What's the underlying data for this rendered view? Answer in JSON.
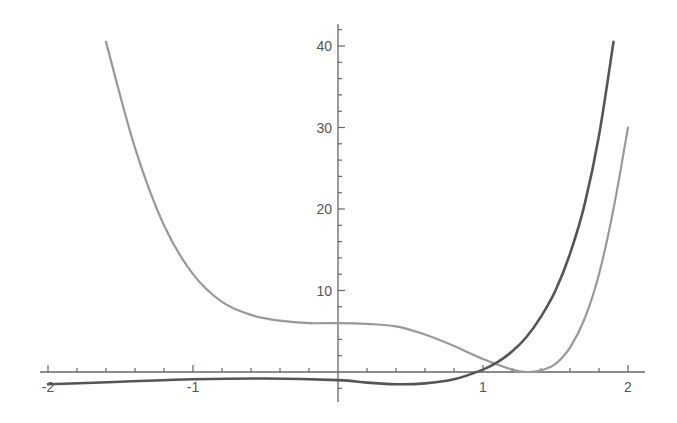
{
  "chart_data": {
    "type": "line",
    "title": "",
    "xlabel": "",
    "ylabel": "",
    "xlim": [
      -2,
      2
    ],
    "ylim": [
      -2,
      42
    ],
    "grid": false,
    "legend": null,
    "axes_style": "axes through origin",
    "x_ticks": [
      {
        "value": -2,
        "label": "-2"
      },
      {
        "value": -1,
        "label": "-1"
      },
      {
        "value": 1,
        "label": "1"
      },
      {
        "value": 2,
        "label": "2"
      }
    ],
    "y_ticks": [
      {
        "value": 10,
        "label": "10"
      },
      {
        "value": 20,
        "label": "20"
      },
      {
        "value": 30,
        "label": "30"
      },
      {
        "value": 40,
        "label": "40"
      }
    ],
    "series": [
      {
        "name": "light curve",
        "color": "#999999",
        "x": [
          -1.6,
          -1.4,
          -1.2,
          -1.0,
          -0.8,
          -0.6,
          -0.4,
          -0.2,
          0.0,
          0.2,
          0.4,
          0.6,
          0.8,
          1.0,
          1.2,
          1.3,
          1.4,
          1.5,
          1.6,
          1.7,
          1.8,
          1.9,
          2.0
        ],
        "y": [
          40.5,
          27.5,
          18.0,
          12.0,
          8.6,
          7.0,
          6.3,
          6.0,
          6.0,
          5.9,
          5.6,
          4.6,
          3.2,
          1.6,
          0.3,
          0.0,
          0.2,
          1.0,
          3.0,
          6.5,
          12.0,
          20.0,
          30.0
        ]
      },
      {
        "name": "dark curve",
        "color": "#555555",
        "x": [
          -2.0,
          -1.5,
          -1.0,
          -0.5,
          0.0,
          0.2,
          0.4,
          0.6,
          0.8,
          1.0,
          1.1,
          1.2,
          1.3,
          1.4,
          1.5,
          1.6,
          1.7,
          1.8,
          1.9
        ],
        "y": [
          -1.5,
          -1.2,
          -0.9,
          -0.8,
          -1.0,
          -1.3,
          -1.5,
          -1.4,
          -0.9,
          0.3,
          1.2,
          2.5,
          4.3,
          6.8,
          10.0,
          14.5,
          20.5,
          29.0,
          40.5
        ]
      }
    ]
  }
}
